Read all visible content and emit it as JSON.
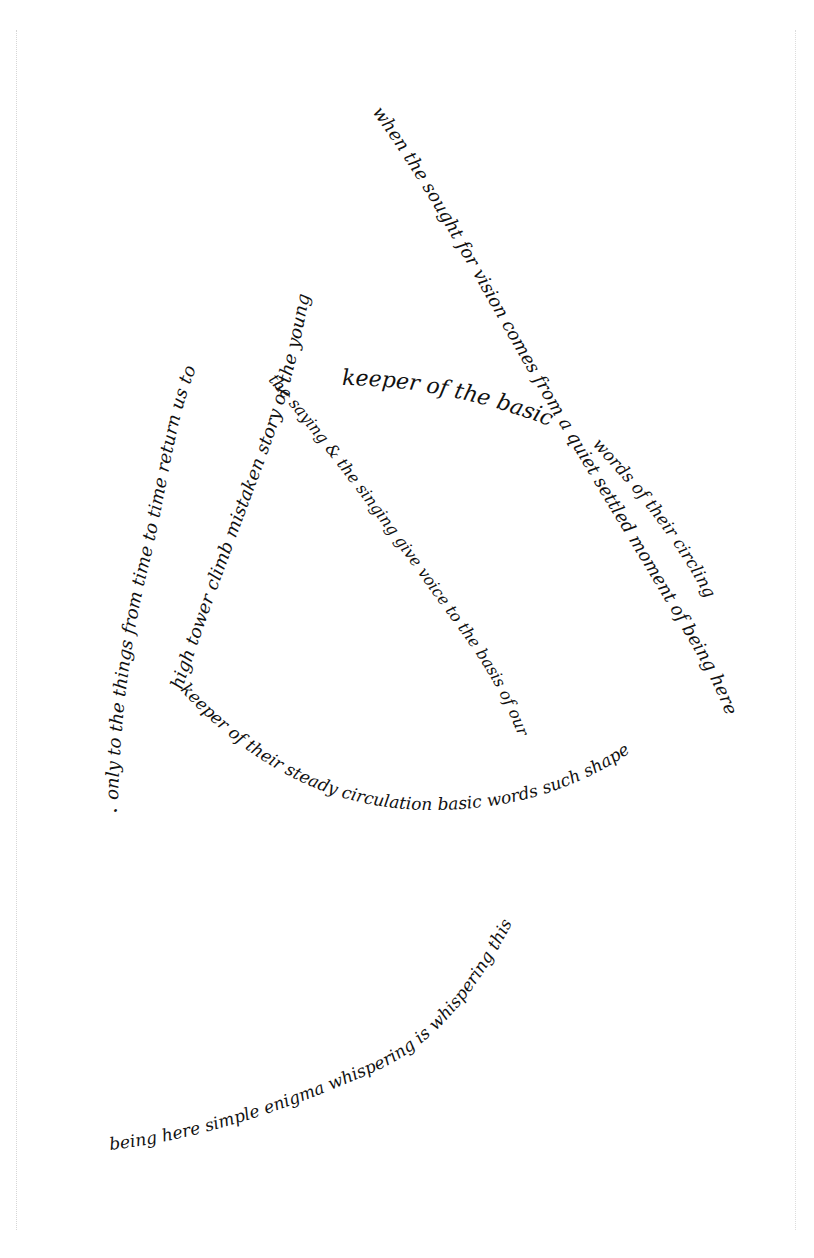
{
  "poem": {
    "ink_color": "#111111",
    "paper_color": "#ffffff",
    "lines": {
      "right_arc": "when the sought for vision comes from a quiet settled moment of being here",
      "circling": "words of their circling",
      "left_arc": "only to the things from time to time return us to",
      "tower": "high tower climb mistaken story of the young",
      "keeper": "keeper of the basic",
      "saying": "the saying & the singing give voice to the basis of our",
      "bottom_arc": "keeper of their steady circulation basic words such shape",
      "tail": "being here simple enigma whispering is whispering this",
      "final_dot": "."
    }
  }
}
